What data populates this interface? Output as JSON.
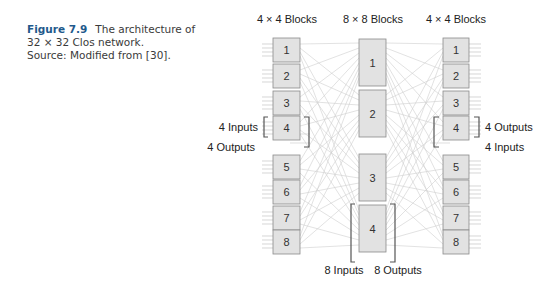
{
  "caption": {
    "figure_label": "Figure 7.9",
    "title_line1": "The architecture of",
    "title_line2": "32 × 32 Clos network.",
    "source": "Source: Modified from [30]."
  },
  "diagram": {
    "left_header": "4 × 4 Blocks",
    "middle_header": "8 × 8 Blocks",
    "right_header": "4 × 4 Blocks",
    "left_blocks": [
      "1",
      "2",
      "3",
      "4",
      "5",
      "6",
      "7",
      "8"
    ],
    "middle_blocks": [
      "1",
      "2",
      "3",
      "4"
    ],
    "right_blocks": [
      "1",
      "2",
      "3",
      "4",
      "5",
      "6",
      "7",
      "8"
    ],
    "left_annotations": {
      "inputs": "4 Inputs",
      "outputs": "4 Outputs"
    },
    "middle_annotations": {
      "inputs": "8 Inputs",
      "outputs": "8 Outputs"
    },
    "right_annotations": {
      "outputs": "4 Outputs",
      "inputs": "4 Inputs"
    },
    "colors": {
      "block_fill": "#e2e2e2",
      "block_stroke": "#8a8a8a",
      "wire": "#c8c8c8",
      "bracket": "#555555"
    }
  }
}
